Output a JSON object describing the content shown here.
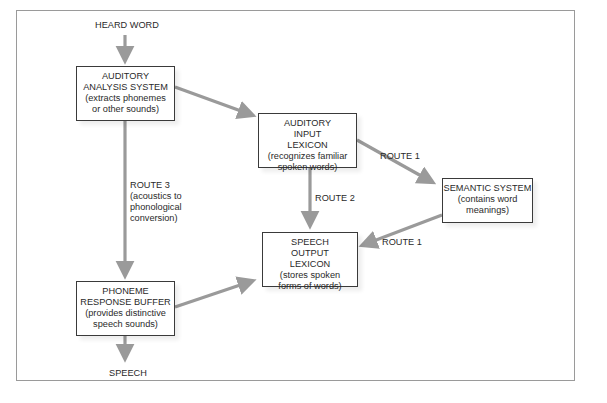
{
  "diagram": {
    "colors": {
      "arrow": "#9a9a9a",
      "box_border": "#3a3a3a",
      "frame_border": "#9a9a9a",
      "text": "#2a2a2a"
    },
    "input_label": "HEARD WORD",
    "output_label": "SPEECH",
    "boxes": {
      "auditory_analysis": {
        "title": "AUDITORY ANALYSIS SYSTEM",
        "desc": "(extracts phonemes or other sounds)"
      },
      "auditory_input_lexicon": {
        "title": "AUDITORY INPUT LEXICON",
        "desc": "(recognizes familiar spoken words)"
      },
      "semantic_system": {
        "title": "SEMANTIC SYSTEM",
        "desc": "(contains word meanings)"
      },
      "speech_output_lexicon": {
        "title": "SPEECH OUTPUT LEXICON",
        "desc": "(stores spoken forms of words)"
      },
      "phoneme_response_buffer": {
        "title": "PHONEME RESPONSE BUFFER",
        "desc": "(provides distinctive speech sounds)"
      }
    },
    "routes": {
      "route1_to_semantic": "ROUTE 1",
      "route1_to_output": "ROUTE 1",
      "route2": "ROUTE 2",
      "route3_title": "ROUTE 3",
      "route3_desc": "(acoustics to phonological conversion)"
    },
    "edges": [
      {
        "from": "heard_word",
        "to": "auditory_analysis"
      },
      {
        "from": "auditory_analysis",
        "to": "auditory_input_lexicon"
      },
      {
        "from": "auditory_input_lexicon",
        "to": "semantic_system",
        "label": "ROUTE 1"
      },
      {
        "from": "semantic_system",
        "to": "speech_output_lexicon",
        "label": "ROUTE 1"
      },
      {
        "from": "auditory_input_lexicon",
        "to": "speech_output_lexicon",
        "label": "ROUTE 2"
      },
      {
        "from": "auditory_analysis",
        "to": "phoneme_response_buffer",
        "label": "ROUTE 3"
      },
      {
        "from": "phoneme_response_buffer",
        "to": "speech_output_lexicon"
      },
      {
        "from": "phoneme_response_buffer",
        "to": "speech"
      }
    ]
  }
}
